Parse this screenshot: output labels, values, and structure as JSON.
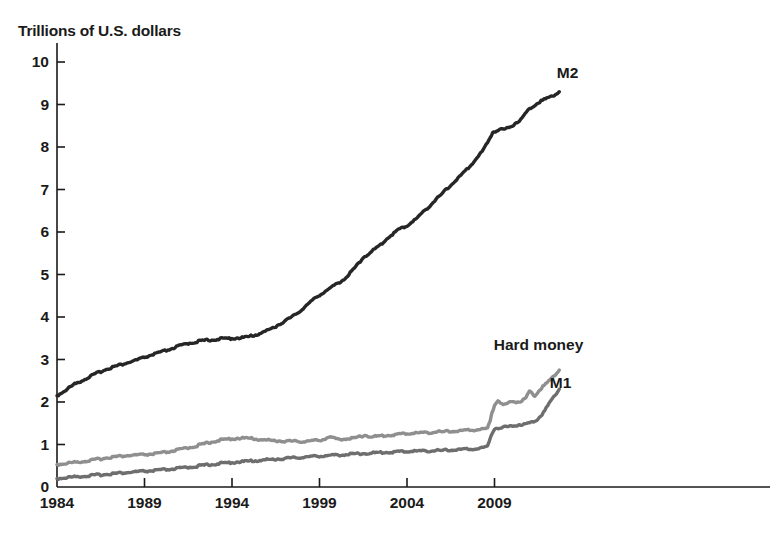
{
  "chart_data": {
    "type": "line",
    "title": "Trillions of U.S. dollars",
    "xlabel": "",
    "ylabel": "Trillions of U.S. dollars",
    "xlim": [
      1984,
      2012.8
    ],
    "ylim": [
      0,
      10.4
    ],
    "grid": false,
    "legend_position": "inline-right-of-series-end",
    "y_ticks": [
      "0",
      "1",
      "2",
      "3",
      "4",
      "5",
      "6",
      "7",
      "8",
      "9",
      "10"
    ],
    "x_ticks": [
      "1984",
      "1989",
      "1994",
      "1999",
      "2004",
      "2009"
    ],
    "colors": {
      "m2": "#262626",
      "hard_money": "#8f8f8f",
      "m1": "#6e6e6e",
      "axis": "#1a1a1a",
      "background": "#ffffff"
    },
    "annotations": [
      {
        "text": "M2",
        "x": 2012.9,
        "y": 9.75
      },
      {
        "text": "Hard money",
        "x": 2009.3,
        "y": 3.35
      },
      {
        "text": "M1",
        "x": 2012.5,
        "y": 2.45
      }
    ],
    "series": [
      {
        "name": "M2",
        "color": "#262626",
        "x": [
          1984.0,
          1984.5,
          1985.0,
          1985.5,
          1986.0,
          1986.5,
          1987.0,
          1987.5,
          1988.0,
          1988.5,
          1989.0,
          1989.5,
          1990.0,
          1990.5,
          1991.0,
          1991.5,
          1992.0,
          1992.5,
          1993.0,
          1993.5,
          1994.0,
          1994.5,
          1995.0,
          1995.5,
          1996.0,
          1996.5,
          1997.0,
          1997.5,
          1998.0,
          1998.5,
          1999.0,
          1999.5,
          2000.0,
          2000.5,
          2001.0,
          2001.5,
          2002.0,
          2002.5,
          2003.0,
          2003.5,
          2004.0,
          2004.5,
          2005.0,
          2005.5,
          2006.0,
          2006.5,
          2007.0,
          2007.5,
          2008.0,
          2008.3,
          2008.6,
          2008.9,
          2009.2,
          2009.6,
          2010.0,
          2010.5,
          2011.0,
          2011.5,
          2012.0,
          2012.4,
          2012.7
        ],
        "values": [
          2.15,
          2.28,
          2.42,
          2.52,
          2.62,
          2.72,
          2.8,
          2.86,
          2.92,
          2.98,
          3.05,
          3.12,
          3.18,
          3.25,
          3.32,
          3.38,
          3.42,
          3.45,
          3.47,
          3.49,
          3.5,
          3.51,
          3.54,
          3.6,
          3.68,
          3.78,
          3.9,
          4.02,
          4.18,
          4.36,
          4.52,
          4.65,
          4.78,
          4.92,
          5.15,
          5.4,
          5.55,
          5.7,
          5.9,
          6.05,
          6.15,
          6.3,
          6.5,
          6.7,
          6.9,
          7.1,
          7.3,
          7.5,
          7.75,
          7.9,
          8.1,
          8.35,
          8.4,
          8.42,
          8.5,
          8.65,
          8.9,
          9.05,
          9.15,
          9.22,
          9.3
        ]
      },
      {
        "name": "Hard money",
        "color": "#8f8f8f",
        "x": [
          1984.0,
          1985.0,
          1986.0,
          1987.0,
          1988.0,
          1989.0,
          1990.0,
          1991.0,
          1992.0,
          1993.0,
          1994.0,
          1994.6,
          1995.2,
          1996.0,
          1997.0,
          1998.0,
          1999.0,
          1999.6,
          2000.0,
          2001.0,
          2001.6,
          2002.0,
          2003.0,
          2004.0,
          2005.0,
          2006.0,
          2007.0,
          2008.0,
          2008.6,
          2008.75,
          2008.85,
          2009.0,
          2009.2,
          2009.5,
          2009.8,
          2010.0,
          2010.4,
          2010.8,
          2011.0,
          2011.3,
          2011.6,
          2012.0,
          2012.4,
          2012.7
        ],
        "values": [
          0.53,
          0.58,
          0.63,
          0.7,
          0.74,
          0.76,
          0.8,
          0.88,
          0.97,
          1.08,
          1.14,
          1.15,
          1.14,
          1.1,
          1.08,
          1.07,
          1.1,
          1.18,
          1.12,
          1.15,
          1.22,
          1.18,
          1.22,
          1.26,
          1.28,
          1.3,
          1.32,
          1.35,
          1.38,
          1.55,
          1.75,
          1.92,
          2.05,
          1.92,
          1.98,
          2.02,
          2.0,
          2.1,
          2.25,
          2.15,
          2.3,
          2.45,
          2.62,
          2.75
        ]
      },
      {
        "name": "M1",
        "color": "#6e6e6e",
        "x": [
          1984.0,
          1985.0,
          1986.0,
          1987.0,
          1988.0,
          1989.0,
          1990.0,
          1991.0,
          1992.0,
          1993.0,
          1994.0,
          1995.0,
          1996.0,
          1997.0,
          1998.0,
          1999.0,
          2000.0,
          2001.0,
          2002.0,
          2003.0,
          2004.0,
          2005.0,
          2006.0,
          2007.0,
          2008.0,
          2008.6,
          2008.8,
          2009.0,
          2009.4,
          2009.8,
          2010.2,
          2010.6,
          2011.0,
          2011.4,
          2011.8,
          2012.2,
          2012.7
        ],
        "values": [
          0.2,
          0.24,
          0.27,
          0.31,
          0.34,
          0.37,
          0.4,
          0.44,
          0.49,
          0.54,
          0.58,
          0.61,
          0.64,
          0.67,
          0.7,
          0.73,
          0.75,
          0.78,
          0.8,
          0.82,
          0.84,
          0.85,
          0.86,
          0.88,
          0.9,
          0.95,
          1.2,
          1.38,
          1.4,
          1.42,
          1.45,
          1.48,
          1.5,
          1.58,
          1.75,
          2.02,
          2.3
        ]
      }
    ]
  },
  "labels": {
    "title": "Trillions of U.S. dollars",
    "m2": "M2",
    "hard_money": "Hard money",
    "m1": "M1"
  }
}
